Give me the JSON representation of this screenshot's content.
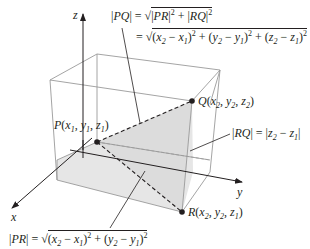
{
  "diagram": {
    "axes": {
      "x": "x",
      "y": "y",
      "z": "z"
    },
    "points": {
      "P": {
        "name": "P",
        "coords": [
          "x1",
          "y1",
          "z1"
        ],
        "label": "P(x₁, y₁, z₁)"
      },
      "Q": {
        "name": "Q",
        "coords": [
          "x2",
          "y2",
          "z2"
        ],
        "label": "Q(x₂, y₂, z₂)"
      },
      "R": {
        "name": "R",
        "coords": [
          "x2",
          "y2",
          "z1"
        ],
        "label": "R(x₂, y₂, z₁)"
      }
    },
    "formulas": {
      "pq_line1": "|PQ| = √(|PR|² + |RQ|²)",
      "pq_line2": "= √((x₂ − x₁)² + (y₂ − y₁)² + (z₂ − z₁)²)",
      "rq": "|RQ| = |z₂ − z₁|",
      "pr": "|PR| = √((x₂ − x₁)² + (y₂ − y₁)²)"
    },
    "colors": {
      "ink": "#231f20",
      "box": "#9a9a9a",
      "shade": "#e6e6e6"
    }
  }
}
